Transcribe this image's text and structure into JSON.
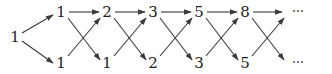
{
  "diagram": {
    "start_node": "1",
    "top_row": [
      "1",
      "2",
      "3",
      "5",
      "8"
    ],
    "bottom_row": [
      "1",
      "1",
      "2",
      "3",
      "5"
    ],
    "continuation": "⋯",
    "colors": {
      "ink": "#222222",
      "edge": "#3a3a3a",
      "background": "#ffffff"
    }
  }
}
